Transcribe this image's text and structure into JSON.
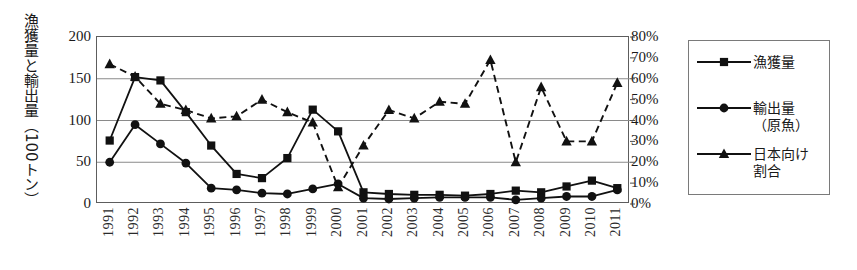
{
  "chart_data": {
    "type": "line",
    "title": "",
    "xlabel": "",
    "ylabel": "漁獲量と輸出量（100トン）",
    "y2label": "",
    "grid": true,
    "legend_position": "right",
    "categories": [
      "1991",
      "1992",
      "1993",
      "1994",
      "1995",
      "1996",
      "1997",
      "1998",
      "1999",
      "2000",
      "2001",
      "2002",
      "2003",
      "2004",
      "2005",
      "2006",
      "2007",
      "2008",
      "2009",
      "2010",
      "2011"
    ],
    "ylim": [
      0,
      200
    ],
    "yticks": [
      "0",
      "50",
      "100",
      "150",
      "200"
    ],
    "y2lim": [
      0,
      80
    ],
    "y2ticks": [
      "0%",
      "10%",
      "20%",
      "30%",
      "40%",
      "50%",
      "60%",
      "70%",
      "80%"
    ],
    "series": [
      {
        "name": "漁獲量",
        "marker": "square",
        "line": "solid",
        "axis": "left",
        "unit": "100トン",
        "values": [
          76,
          152,
          148,
          110,
          70,
          36,
          31,
          55,
          113,
          87,
          14,
          12,
          11,
          11,
          10,
          12,
          16,
          14,
          21,
          28,
          19
        ]
      },
      {
        "name": "輸出量\n（原魚）",
        "marker": "circle",
        "line": "solid",
        "axis": "left",
        "unit": "100トン",
        "values": [
          50,
          95,
          72,
          49,
          19,
          17,
          13,
          12,
          18,
          24,
          7,
          6,
          7,
          8,
          8,
          8,
          5,
          7,
          9,
          9,
          17
        ]
      },
      {
        "name": "日本向け\n割合",
        "marker": "triangle",
        "line": "dashed",
        "axis": "right",
        "unit": "%",
        "values": [
          67,
          61,
          48,
          45,
          41,
          42,
          50,
          44,
          39,
          8,
          28,
          45,
          41,
          49,
          48,
          69,
          20,
          56,
          30,
          30,
          58
        ]
      }
    ]
  },
  "legend": {
    "entries": [
      {
        "label": "漁獲量",
        "marker": "square-marker",
        "line": "solid"
      },
      {
        "label": "輸出量\n（原魚）",
        "marker": "circle-marker",
        "line": "solid"
      },
      {
        "label": "日本向け\n割合",
        "marker": "triangle-marker",
        "line": "solid"
      }
    ]
  }
}
